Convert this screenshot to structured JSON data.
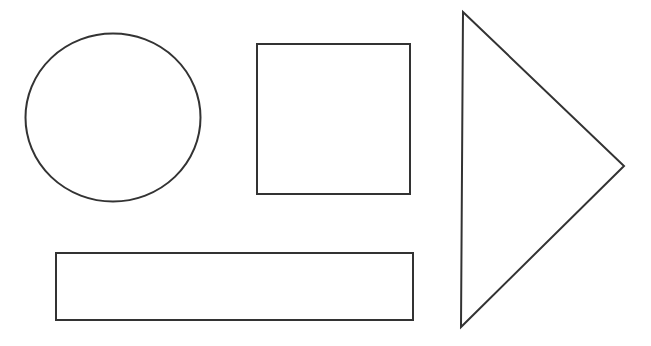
{
  "canvas": {
    "width": 651,
    "height": 346,
    "background": "#ffffff"
  },
  "style": {
    "stroke": "#333333",
    "stroke_width": 2,
    "fill": "#ffffff"
  },
  "shapes": [
    {
      "type": "circle",
      "name": "circle",
      "cx": 113,
      "cy": 117.5,
      "rx": 87.5,
      "ry": 84
    },
    {
      "type": "rect",
      "name": "square",
      "x": 257,
      "y": 44,
      "width": 153,
      "height": 150
    },
    {
      "type": "polygon",
      "name": "triangle",
      "points": "463,12 624,166 461,327"
    },
    {
      "type": "rect",
      "name": "rectangle",
      "x": 56,
      "y": 253,
      "width": 357,
      "height": 67
    }
  ]
}
